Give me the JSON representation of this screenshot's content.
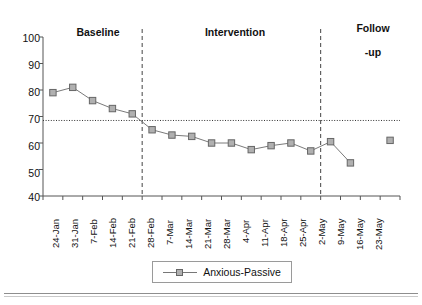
{
  "chart_data": {
    "type": "line",
    "title": "",
    "xlabel": "",
    "ylabel": "",
    "ylim": [
      40,
      100
    ],
    "yticks": [
      40,
      50,
      60,
      70,
      80,
      90,
      100
    ],
    "grid": false,
    "legend_position": "bottom",
    "categories": [
      "24-Jan",
      "31-Jan",
      "7-Feb",
      "14-Feb",
      "21-Feb",
      "28-Feb",
      "7-Mar",
      "14-Mar",
      "21-Mar",
      "28-Mar",
      "4-Apr",
      "11-Apr",
      "18-Apr",
      "25-Apr",
      "2-May",
      "9-May",
      "16-May",
      "23-May"
    ],
    "series": [
      {
        "name": "Anxious-Passive",
        "marker": "square",
        "color": "#b0b0b0",
        "line_color": "#7a7a7a",
        "values": [
          79,
          81,
          76,
          73,
          71,
          65,
          63,
          62.5,
          60,
          60,
          57.5,
          59,
          60,
          57,
          60.5,
          52.5,
          null,
          61
        ]
      }
    ],
    "phases": [
      {
        "label": "Baseline",
        "start": "24-Jan",
        "end": "21-Feb"
      },
      {
        "label": "Intervention",
        "start": "28-Feb",
        "end": "25-Apr"
      },
      {
        "label": "Follow\n-up",
        "start": "2-May",
        "end": "23-May"
      }
    ],
    "phase_dividers": [
      "21-Feb/28-Feb",
      "25-Apr/2-May"
    ],
    "reference_line": {
      "value": 68.5,
      "style": "dotted"
    },
    "annotations": []
  },
  "legend": {
    "entries": [
      {
        "label": "Anxious-Passive",
        "marker": "square"
      }
    ]
  },
  "axis": {
    "y_labels": [
      "100",
      "90",
      "80",
      "70",
      "60",
      "50",
      "40"
    ],
    "x_labels": [
      "24-Jan",
      "31-Jan",
      "7-Feb",
      "14-Feb",
      "21-Feb",
      "28-Feb",
      "7-Mar",
      "14-Mar",
      "21-Mar",
      "28-Mar",
      "4-Apr",
      "11-Apr",
      "18-Apr",
      "25-Apr",
      "2-May",
      "9-May",
      "16-May",
      "23-May"
    ]
  },
  "phase_headers": {
    "baseline": "Baseline",
    "intervention": "Intervention",
    "followup_line1": "Follow",
    "followup_line2": "-up"
  },
  "colors": {
    "marker_fill": "#b0b0b0",
    "marker_stroke": "#666666",
    "line": "#7a7a7a",
    "axis": "#555555",
    "divider": "#444444",
    "reference": "#333333"
  }
}
